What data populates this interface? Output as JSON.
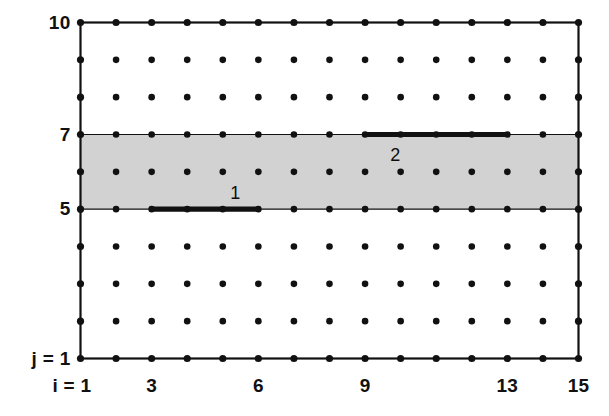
{
  "figure": {
    "kind": "grid-mesh-diagram",
    "background_color": "#ffffff",
    "line_color": "#111111",
    "dot_color": "#111111",
    "shaded_band_color": "#d2d2d2"
  },
  "axes": {
    "x": {
      "variable": "i",
      "min": 1,
      "max": 15,
      "origin_label": "i = 1",
      "tick_values": [
        3,
        6,
        9,
        13,
        15
      ],
      "tick_labels": [
        "3",
        "6",
        "9",
        "13",
        "15"
      ]
    },
    "y": {
      "variable": "j",
      "min": 1,
      "max": 10,
      "origin_label": "j = 1",
      "tick_values": [
        5,
        7,
        10
      ],
      "tick_labels": [
        "5",
        "7",
        "10"
      ]
    }
  },
  "chart_data": {
    "type": "scatter",
    "title": "",
    "xlabel": "i = 1",
    "ylabel": "j = 1",
    "xlim": [
      1,
      15
    ],
    "ylim": [
      1,
      10
    ],
    "grid": false,
    "legend": "none",
    "nodes": {
      "i_values": [
        1,
        2,
        3,
        4,
        5,
        6,
        7,
        8,
        9,
        10,
        11,
        12,
        13,
        14,
        15
      ],
      "j_values": [
        1,
        2,
        3,
        4,
        5,
        6,
        7,
        8,
        9,
        10
      ],
      "count": 150,
      "marker": "filled-circle"
    },
    "shaded_bands": [
      {
        "name": "shaded-band",
        "j_from": 5,
        "j_to": 7,
        "i_from": 1,
        "i_to": 15,
        "color": "#d2d2d2"
      }
    ],
    "elements": [
      {
        "label": "1",
        "j": 5,
        "i_from": 3,
        "i_to": 6,
        "label_position": "above"
      },
      {
        "label": "2",
        "j": 7,
        "i_from": 9,
        "i_to": 13,
        "label_position": "below"
      }
    ],
    "border": {
      "i_from": 1,
      "i_to": 15,
      "j_from": 1,
      "j_to": 10
    }
  }
}
